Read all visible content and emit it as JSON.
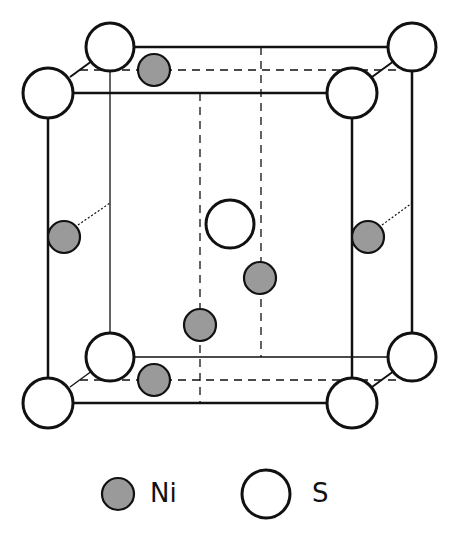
{
  "diagram": {
    "colors": {
      "ni_fill": "#9a9a9a",
      "s_fill": "#ffffff",
      "stroke": "#111111"
    },
    "legend": {
      "items": [
        {
          "symbol": "filled-circle",
          "label": "Ni"
        },
        {
          "symbol": "open-circle",
          "label": "S"
        }
      ]
    }
  }
}
